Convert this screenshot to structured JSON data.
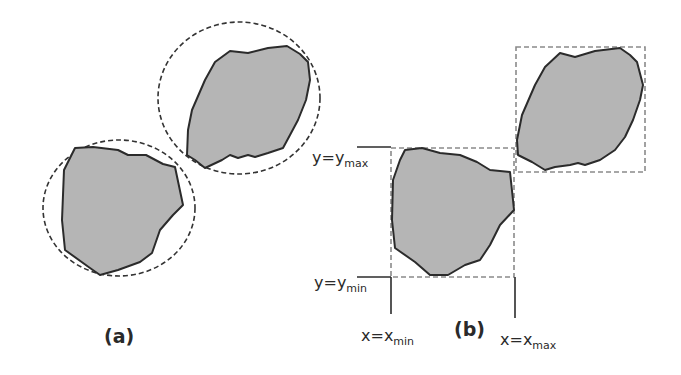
{
  "figure": {
    "panel_a": {
      "label": "(a)",
      "description": "Particles enclosed by bounding circles",
      "particles": [
        {
          "name": "particle-lower",
          "points": "75,148 93,147 118,150 128,155 146,155 163,164 175,167 183,205 173,215 160,230 152,253 140,262 118,270 100,275 90,268 65,250 62,220 64,170",
          "circle": {
            "cx": 119,
            "cy": 208,
            "rx": 76,
            "ry": 68
          }
        },
        {
          "name": "particle-upper",
          "points": "230,51 248,53 268,48 287,46 300,54 308,62 310,80 306,100 298,120 290,135 283,148 268,153 255,157 248,155 238,158 230,155 222,160 205,168 195,160 187,155 188,130 192,110 205,80 215,62",
          "circle": {
            "cx": 239,
            "cy": 98,
            "rx": 81,
            "ry": 76
          }
        }
      ]
    },
    "panel_b": {
      "label": "(b)",
      "description": "Particles enclosed by bounding boxes",
      "particles": [
        {
          "name": "particle-lower",
          "points": "405,150 422,148 440,153 460,155 477,162 490,170 510,172 513,200 514,210 500,225 490,245 480,260 465,265 448,275 430,275 415,262 395,248 392,220 393,180 400,160",
          "box": {
            "x": 391,
            "y": 148,
            "w": 123,
            "h": 129
          }
        },
        {
          "name": "particle-upper",
          "points": "560,53 575,57 595,51 620,48 630,55 637,62 643,85 640,100 633,120 625,137 615,150 600,160 585,165 578,163 570,165 555,167 545,170 532,162 518,155 517,140 522,115 535,85 545,67",
          "box": {
            "x": 516,
            "y": 47,
            "w": 129,
            "h": 125
          }
        }
      ],
      "annotations": {
        "y_max": {
          "main": "y=y",
          "sub": "max"
        },
        "y_min": {
          "main": "y=y",
          "sub": "min"
        },
        "x_min": {
          "main": "x=x",
          "sub": "min"
        },
        "x_max": {
          "main": "x=x",
          "sub": "max"
        }
      }
    },
    "colors": {
      "particle_fill": "#b5b5b5",
      "outline": "#2b2b2b",
      "bounding_box": "#8a8a8a",
      "text": "#2a2a2a"
    }
  }
}
